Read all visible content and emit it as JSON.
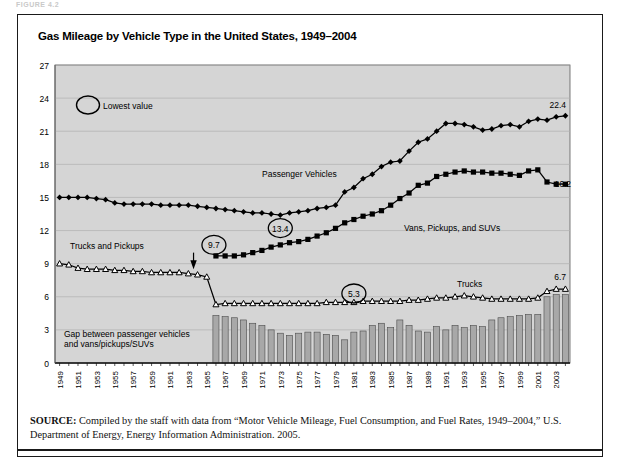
{
  "figure_tag": "FIGURE 4.2",
  "title": "Gas Mileage by Vehicle Type in the United States, 1949–2004",
  "source": {
    "label": "SOURCE:",
    "text": " Compiled by the staff with data from “Motor Vehicle Mileage, Fuel Consumption, and Fuel Rates, 1949–2004,” U.S. Department of Energy, Energy Information Administration. 2005."
  },
  "legend": {
    "lowest_value_label": "Lowest value"
  },
  "annotations": {
    "passenger_vehicles": "Passenger Vehicles",
    "vans_pickups_suvs": "Vans, Pickups, and SUVs",
    "trucks_and_pickups": "Trucks and Pickups",
    "trucks": "Trucks",
    "gap_line1": "Gap between passenger vehicles",
    "gap_line2": "and vans/pickups/SUVs"
  },
  "callouts": {
    "passenger_low": "13.4",
    "vans_low": "9.7",
    "trucks_low": "5.3",
    "passenger_end": "22.4",
    "vans_end": "16.2",
    "trucks_end": "6.7"
  },
  "colors": {
    "plot_background": "#d5d5d5",
    "bar_fill": "#a8a8a8",
    "line_color": "#000000",
    "grid_color": "#b0b0b0",
    "frame": "#1a1a1a"
  },
  "chart_data": {
    "type": "line",
    "title": "Gas Mileage by Vehicle Type in the United States, 1949–2004",
    "xlabel": "",
    "ylabel": "Miles per Gallon",
    "ylim": [
      0,
      27
    ],
    "yticks": [
      0,
      3,
      6,
      9,
      12,
      15,
      18,
      21,
      24,
      27
    ],
    "grid": true,
    "legend_position": "inline-annotations",
    "x": [
      1949,
      1950,
      1951,
      1952,
      1953,
      1954,
      1955,
      1956,
      1957,
      1958,
      1959,
      1960,
      1961,
      1962,
      1963,
      1964,
      1965,
      1966,
      1967,
      1968,
      1969,
      1970,
      1971,
      1972,
      1973,
      1974,
      1975,
      1976,
      1977,
      1978,
      1979,
      1980,
      1981,
      1982,
      1983,
      1984,
      1985,
      1986,
      1987,
      1988,
      1989,
      1990,
      1991,
      1992,
      1993,
      1994,
      1995,
      1996,
      1997,
      1998,
      1999,
      2000,
      2001,
      2002,
      2003,
      2004
    ],
    "xtick_labels": [
      "1949",
      "1951",
      "1953",
      "1955",
      "1957",
      "1959",
      "1961",
      "1963",
      "1965",
      "1967",
      "1969",
      "1971",
      "1973",
      "1975",
      "1977",
      "1979",
      "1981",
      "1983",
      "1985",
      "1987",
      "1989",
      "1991",
      "1993",
      "1995",
      "1997",
      "1999",
      "2001",
      "2003"
    ],
    "series": [
      {
        "name": "Passenger Vehicles",
        "marker": "diamond",
        "values": [
          15.0,
          15.0,
          15.0,
          15.0,
          14.9,
          14.8,
          14.5,
          14.4,
          14.4,
          14.4,
          14.4,
          14.3,
          14.3,
          14.3,
          14.3,
          14.2,
          14.1,
          14.0,
          13.9,
          13.8,
          13.7,
          13.6,
          13.6,
          13.5,
          13.4,
          13.6,
          13.7,
          13.8,
          14.0,
          14.1,
          14.3,
          15.5,
          15.9,
          16.7,
          17.1,
          17.8,
          18.2,
          18.3,
          19.2,
          20.0,
          20.3,
          21.0,
          21.7,
          21.7,
          21.6,
          21.4,
          21.1,
          21.2,
          21.5,
          21.6,
          21.4,
          21.9,
          22.1,
          22.0,
          22.3,
          22.4
        ],
        "lowest_value": 13.4,
        "lowest_year": 1973,
        "last_value": 22.4
      },
      {
        "name": "Vans, Pickups, and SUVs",
        "marker": "square",
        "values": [
          null,
          null,
          null,
          null,
          null,
          null,
          null,
          null,
          null,
          null,
          null,
          null,
          null,
          null,
          null,
          null,
          null,
          9.7,
          9.7,
          9.7,
          9.8,
          10.0,
          10.2,
          10.5,
          10.7,
          10.9,
          11.0,
          11.2,
          11.5,
          11.8,
          12.2,
          12.7,
          13.0,
          13.3,
          13.5,
          13.8,
          14.3,
          14.9,
          15.4,
          16.1,
          16.3,
          16.9,
          17.1,
          17.3,
          17.4,
          17.3,
          17.3,
          17.2,
          17.2,
          17.1,
          17.0,
          17.4,
          17.5,
          16.4,
          16.2,
          16.2
        ],
        "lowest_value": 9.7,
        "lowest_year": 1966,
        "last_value": 16.2
      },
      {
        "name": "Trucks",
        "marker": "triangle",
        "values": [
          9.0,
          8.9,
          8.6,
          8.5,
          8.5,
          8.5,
          8.4,
          8.4,
          8.3,
          8.3,
          8.2,
          8.2,
          8.2,
          8.2,
          8.1,
          8.0,
          7.8,
          5.3,
          5.4,
          5.4,
          5.4,
          5.4,
          5.4,
          5.4,
          5.4,
          5.4,
          5.4,
          5.4,
          5.4,
          5.5,
          5.5,
          5.5,
          5.5,
          5.6,
          5.6,
          5.6,
          5.6,
          5.6,
          5.7,
          5.7,
          5.8,
          5.9,
          5.9,
          6.0,
          6.1,
          6.0,
          5.9,
          5.8,
          5.8,
          5.8,
          5.8,
          5.8,
          5.9,
          6.5,
          6.7,
          6.7
        ],
        "lowest_value": 5.3,
        "lowest_year": 1966,
        "last_value": 6.7
      }
    ],
    "bars": {
      "name": "Gap between passenger vehicles and vans/pickups/SUVs",
      "start_year": 1966,
      "values": [
        4.3,
        4.2,
        4.1,
        3.9,
        3.6,
        3.4,
        3.0,
        2.7,
        2.5,
        2.7,
        2.8,
        2.8,
        2.6,
        2.5,
        2.1,
        2.8,
        2.9,
        3.4,
        3.6,
        3.2,
        3.9,
        3.4,
        2.9,
        2.8,
        3.3,
        3.0,
        3.4,
        3.2,
        3.4,
        3.3,
        3.9,
        4.1,
        4.2,
        4.3,
        4.4,
        4.4,
        6.0,
        6.2,
        6.2
      ]
    }
  }
}
